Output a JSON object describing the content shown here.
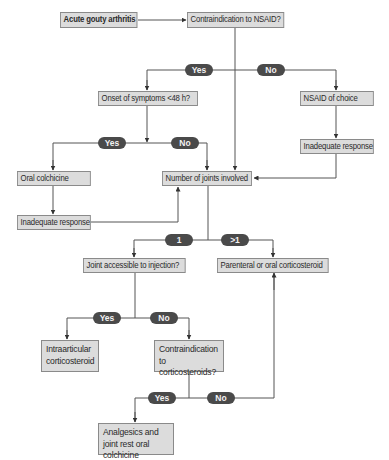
{
  "diagram": {
    "type": "flowchart",
    "colors": {
      "box_fill": "#dcdcdc",
      "box_border": "#8a8a8a",
      "pill_fill": "#4a4a4a",
      "pill_text": "#f2f2f2",
      "line": "#555555"
    },
    "nodes": {
      "start": "Acute gouty arthritis",
      "nsaid_contra": "Contraindication to NSAID?",
      "onset": "Onset of symptoms <48 h?",
      "nsaid_choice": "NSAID of choice",
      "inadequate_right": "Inadequate response",
      "oral_colchicine": "Oral colchicine",
      "joints_involved": "Number of joints involved",
      "inadequate_left": "Inadequate response",
      "joint_accessible": "Joint accessible to injection?",
      "parenteral": "Parenteral or oral corticosteroid",
      "intraarticular": "Intraarticular corticosteroid",
      "cortico_contra": "Contraindication to corticosteroids?",
      "analgesics": "Analgesics and joint rest oral colchicine"
    },
    "labels": {
      "nsaid_yes": "Yes",
      "nsaid_no": "No",
      "onset_yes": "Yes",
      "onset_no": "No",
      "joints_one": "1",
      "joints_many": ">1",
      "access_yes": "Yes",
      "access_no": "No",
      "cortico_yes": "Yes",
      "cortico_no": "No"
    },
    "edges": [
      {
        "from": "start",
        "to": "nsaid_contra"
      },
      {
        "from": "nsaid_contra",
        "to": "onset",
        "label": "Yes"
      },
      {
        "from": "nsaid_contra",
        "to": "nsaid_choice",
        "label": "No"
      },
      {
        "from": "nsaid_contra",
        "to": "joints_involved"
      },
      {
        "from": "nsaid_choice",
        "to": "inadequate_right"
      },
      {
        "from": "inadequate_right",
        "to": "joints_involved"
      },
      {
        "from": "onset",
        "to": "oral_colchicine",
        "label": "Yes"
      },
      {
        "from": "onset",
        "to": "joints_involved",
        "label": "No"
      },
      {
        "from": "oral_colchicine",
        "to": "inadequate_left"
      },
      {
        "from": "inadequate_left",
        "to": "joints_involved"
      },
      {
        "from": "joints_involved",
        "to": "joint_accessible",
        "label": "1"
      },
      {
        "from": "joints_involved",
        "to": "parenteral",
        "label": ">1"
      },
      {
        "from": "joint_accessible",
        "to": "intraarticular",
        "label": "Yes"
      },
      {
        "from": "joint_accessible",
        "to": "cortico_contra",
        "label": "No"
      },
      {
        "from": "cortico_contra",
        "to": "analgesics",
        "label": "Yes"
      },
      {
        "from": "cortico_contra",
        "to": "parenteral",
        "label": "No"
      }
    ]
  }
}
